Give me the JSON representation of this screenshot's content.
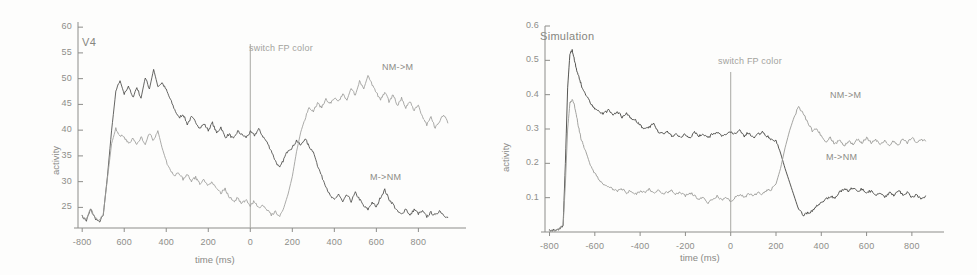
{
  "figure": {
    "panels": [
      {
        "id": "v4",
        "title": "V4",
        "event_label": "switch FP color",
        "series_labels": {
          "upper": "NM->M",
          "lower": "M->NM"
        }
      },
      {
        "id": "sim",
        "title": "Simulation",
        "event_label": "switch FP color",
        "series_labels": {
          "upper": "NM->M",
          "lower": "M->NM"
        }
      }
    ]
  },
  "chart_data": [
    {
      "type": "line",
      "title": "V4",
      "xlabel": "time (ms)",
      "ylabel": "activity",
      "xlim": [
        -820,
        960
      ],
      "ylim": [
        21,
        61
      ],
      "xticks": [
        -800,
        -600,
        -400,
        -200,
        0,
        200,
        400,
        600,
        800
      ],
      "xticklabels": [
        "-800",
        "600",
        "400",
        "200",
        "0",
        "200",
        "400",
        "600",
        "800"
      ],
      "yticks": [
        25,
        30,
        35,
        40,
        45,
        50,
        55,
        60
      ],
      "yticklabels": [
        "25",
        "30",
        "35",
        "40",
        "45",
        "50",
        "55",
        "60"
      ],
      "grid": false,
      "legend": "inline-annotations",
      "annotations": [
        {
          "text": "switch FP color",
          "x": 0,
          "type": "vertical-line"
        },
        {
          "text": "NM->M",
          "x": 640,
          "y": 49
        },
        {
          "text": "M->NM",
          "x": 620,
          "y": 29
        }
      ],
      "series": [
        {
          "name": "NM->M",
          "color": "#4a4a48",
          "x": [
            -800,
            -780,
            -760,
            -740,
            -720,
            -700,
            -680,
            -660,
            -640,
            -620,
            -600,
            -580,
            -560,
            -540,
            -520,
            -500,
            -480,
            -460,
            -440,
            -420,
            -400,
            -380,
            -360,
            -340,
            -320,
            -300,
            -280,
            -260,
            -240,
            -220,
            -200,
            -180,
            -160,
            -140,
            -120,
            -100,
            -80,
            -60,
            -40,
            -20,
            0,
            20,
            40,
            60,
            80,
            100,
            120,
            140,
            160,
            180,
            200,
            220,
            240,
            260,
            280,
            300,
            320,
            340,
            360,
            380,
            400,
            420,
            440,
            460,
            480,
            500,
            520,
            540,
            560,
            580,
            600,
            620,
            640,
            660,
            680,
            700,
            720,
            740,
            760,
            780,
            800,
            820,
            840,
            860,
            880,
            900,
            920,
            940
          ],
          "y": [
            23.2,
            22.4,
            24.6,
            23.0,
            22.1,
            23.4,
            31.0,
            40.0,
            47.5,
            49.6,
            47.0,
            48.6,
            46.3,
            48.3,
            46.2,
            50.2,
            48.0,
            51.8,
            48.5,
            49.2,
            47.8,
            45.9,
            44.0,
            42.4,
            43.1,
            41.2,
            42.5,
            41.6,
            40.4,
            41.2,
            40.0,
            41.4,
            39.4,
            40.6,
            38.6,
            39.2,
            38.2,
            39.8,
            39.1,
            38.6,
            39.6,
            39.0,
            40.2,
            38.8,
            37.6,
            36.0,
            34.0,
            32.6,
            34.4,
            36.2,
            36.6,
            38.0,
            37.0,
            38.4,
            36.8,
            35.8,
            33.2,
            31.0,
            29.2,
            27.2,
            26.4,
            27.6,
            26.0,
            27.4,
            26.2,
            27.8,
            26.6,
            25.2,
            24.6,
            26.0,
            25.0,
            27.0,
            28.4,
            26.6,
            25.6,
            24.2,
            23.6,
            24.8,
            23.4,
            24.6,
            23.8,
            24.2,
            23.2,
            24.0,
            23.4,
            24.4,
            23.6,
            23.0
          ]
        },
        {
          "name": "M->NM",
          "color": "#9c9c99",
          "x": [
            -800,
            -780,
            -760,
            -740,
            -720,
            -700,
            -680,
            -660,
            -640,
            -620,
            -600,
            -580,
            -560,
            -540,
            -520,
            -500,
            -480,
            -460,
            -440,
            -420,
            -400,
            -380,
            -360,
            -340,
            -320,
            -300,
            -280,
            -260,
            -240,
            -220,
            -200,
            -180,
            -160,
            -140,
            -120,
            -100,
            -80,
            -60,
            -40,
            -20,
            0,
            20,
            40,
            60,
            80,
            100,
            120,
            140,
            160,
            180,
            200,
            220,
            240,
            260,
            280,
            300,
            320,
            340,
            360,
            380,
            400,
            420,
            440,
            460,
            480,
            500,
            520,
            540,
            560,
            580,
            600,
            620,
            640,
            660,
            680,
            700,
            720,
            740,
            760,
            780,
            800,
            820,
            840,
            860,
            880,
            900,
            920,
            940
          ],
          "y": [
            23.4,
            22.6,
            24.8,
            23.2,
            22.3,
            23.6,
            30.6,
            37.4,
            40.3,
            39.0,
            38.6,
            37.4,
            38.4,
            37.2,
            38.6,
            37.4,
            39.3,
            38.0,
            39.9,
            36.6,
            34.0,
            32.2,
            31.0,
            31.8,
            30.4,
            31.4,
            30.2,
            30.8,
            29.6,
            30.4,
            29.2,
            30.0,
            28.4,
            27.8,
            28.6,
            27.0,
            26.2,
            26.8,
            25.8,
            26.4,
            25.4,
            26.2,
            25.0,
            25.6,
            24.6,
            23.6,
            24.2,
            23.2,
            25.0,
            27.6,
            31.0,
            35.8,
            39.6,
            42.2,
            44.4,
            43.6,
            45.2,
            44.4,
            46.0,
            45.2,
            46.4,
            45.6,
            47.0,
            45.8,
            48.2,
            46.8,
            49.4,
            48.0,
            50.6,
            48.8,
            47.2,
            46.0,
            47.4,
            45.6,
            46.8,
            44.8,
            46.2,
            44.4,
            45.6,
            43.8,
            44.8,
            42.6,
            41.0,
            42.8,
            40.4,
            41.6,
            43.0,
            41.4
          ]
        }
      ]
    },
    {
      "type": "line",
      "title": "Simulation",
      "xlabel": "time (ms)",
      "ylabel": "activity",
      "xlim": [
        -820,
        880
      ],
      "ylim": [
        0,
        0.6
      ],
      "xticks": [
        -800,
        -600,
        -400,
        -200,
        0,
        200,
        400,
        600,
        800
      ],
      "xticklabels": [
        "-800",
        "-600",
        "-400",
        "-200",
        "0",
        "200",
        "400",
        "600",
        "800"
      ],
      "yticks": [
        0.1,
        0.2,
        0.3,
        0.4,
        0.5,
        0.6
      ],
      "yticklabels": [
        "0.1",
        "0.2",
        "0.3",
        "0.4",
        "0.5",
        "0.6"
      ],
      "grid": false,
      "legend": "inline-annotations",
      "annotations": [
        {
          "text": "switch FP color",
          "x": 0,
          "type": "vertical-line"
        },
        {
          "text": "NM->M",
          "x": 600,
          "y": 0.355
        },
        {
          "text": "M->NM",
          "x": 590,
          "y": 0.195
        }
      ],
      "series": [
        {
          "name": "NM->M",
          "color": "#43433f",
          "x": [
            -800,
            -780,
            -760,
            -740,
            -730,
            -720,
            -710,
            -700,
            -690,
            -680,
            -670,
            -660,
            -650,
            -640,
            -620,
            -600,
            -580,
            -560,
            -540,
            -520,
            -500,
            -480,
            -460,
            -440,
            -420,
            -400,
            -380,
            -360,
            -340,
            -320,
            -300,
            -280,
            -260,
            -240,
            -220,
            -200,
            -180,
            -160,
            -140,
            -120,
            -100,
            -80,
            -60,
            -40,
            -20,
            0,
            20,
            40,
            60,
            80,
            100,
            120,
            140,
            160,
            180,
            200,
            220,
            240,
            260,
            280,
            300,
            320,
            340,
            360,
            380,
            400,
            420,
            440,
            460,
            480,
            500,
            520,
            540,
            560,
            580,
            600,
            620,
            640,
            660,
            680,
            700,
            720,
            740,
            760,
            780,
            800,
            820,
            840,
            860
          ],
          "y": [
            0.005,
            0.005,
            0.006,
            0.02,
            0.2,
            0.42,
            0.52,
            0.53,
            0.5,
            0.47,
            0.45,
            0.43,
            0.41,
            0.4,
            0.375,
            0.36,
            0.35,
            0.345,
            0.355,
            0.34,
            0.35,
            0.335,
            0.345,
            0.33,
            0.325,
            0.31,
            0.3,
            0.305,
            0.315,
            0.29,
            0.285,
            0.295,
            0.28,
            0.285,
            0.275,
            0.285,
            0.275,
            0.29,
            0.28,
            0.285,
            0.275,
            0.285,
            0.29,
            0.28,
            0.285,
            0.29,
            0.285,
            0.295,
            0.28,
            0.29,
            0.275,
            0.285,
            0.29,
            0.28,
            0.27,
            0.265,
            0.23,
            0.185,
            0.145,
            0.105,
            0.065,
            0.05,
            0.055,
            0.06,
            0.075,
            0.085,
            0.095,
            0.105,
            0.1,
            0.115,
            0.125,
            0.12,
            0.13,
            0.12,
            0.125,
            0.115,
            0.12,
            0.105,
            0.115,
            0.1,
            0.115,
            0.105,
            0.12,
            0.11,
            0.115,
            0.1,
            0.11,
            0.095,
            0.105
          ]
        },
        {
          "name": "M->NM",
          "color": "#9a9a96",
          "x": [
            -800,
            -780,
            -760,
            -740,
            -730,
            -720,
            -710,
            -700,
            -690,
            -680,
            -670,
            -660,
            -650,
            -640,
            -620,
            -600,
            -580,
            -560,
            -540,
            -520,
            -500,
            -480,
            -460,
            -440,
            -420,
            -400,
            -380,
            -360,
            -340,
            -320,
            -300,
            -280,
            -260,
            -240,
            -220,
            -200,
            -180,
            -160,
            -140,
            -120,
            -100,
            -80,
            -60,
            -40,
            -20,
            0,
            20,
            40,
            60,
            80,
            100,
            120,
            140,
            160,
            180,
            200,
            220,
            240,
            260,
            280,
            300,
            320,
            340,
            360,
            380,
            400,
            420,
            440,
            460,
            480,
            500,
            520,
            540,
            560,
            580,
            600,
            620,
            640,
            660,
            680,
            700,
            720,
            740,
            760,
            780,
            800,
            820,
            840,
            860
          ],
          "y": [
            0.004,
            0.004,
            0.005,
            0.018,
            0.14,
            0.3,
            0.375,
            0.385,
            0.37,
            0.335,
            0.3,
            0.27,
            0.25,
            0.235,
            0.195,
            0.17,
            0.15,
            0.14,
            0.13,
            0.125,
            0.12,
            0.125,
            0.115,
            0.12,
            0.11,
            0.12,
            0.115,
            0.125,
            0.115,
            0.12,
            0.11,
            0.115,
            0.12,
            0.11,
            0.115,
            0.105,
            0.115,
            0.105,
            0.095,
            0.1,
            0.085,
            0.095,
            0.105,
            0.095,
            0.1,
            0.09,
            0.1,
            0.11,
            0.1,
            0.11,
            0.105,
            0.115,
            0.11,
            0.12,
            0.125,
            0.14,
            0.185,
            0.245,
            0.295,
            0.335,
            0.365,
            0.345,
            0.32,
            0.295,
            0.3,
            0.28,
            0.26,
            0.275,
            0.255,
            0.27,
            0.25,
            0.265,
            0.255,
            0.27,
            0.26,
            0.275,
            0.26,
            0.27,
            0.255,
            0.265,
            0.25,
            0.265,
            0.255,
            0.27,
            0.26,
            0.275,
            0.26,
            0.27,
            0.265
          ]
        }
      ]
    }
  ]
}
